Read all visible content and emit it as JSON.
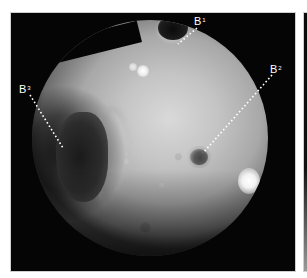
{
  "figure": {
    "type": "endoscopic-photograph",
    "background_color": "#050505",
    "labels": [
      {
        "id": "B1",
        "base": "B",
        "superscript": "1",
        "x": 194,
        "y": 16,
        "target": "upper dark opening"
      },
      {
        "id": "B2",
        "base": "B",
        "superscript": "2",
        "x": 270,
        "y": 64,
        "target": "ringed opening, center-right"
      },
      {
        "id": "B3",
        "base": "B",
        "superscript": "3",
        "x": 19,
        "y": 84,
        "target": "large dark recess, left"
      }
    ],
    "leader_color": "#ffffff",
    "leader_style": "dotted"
  }
}
